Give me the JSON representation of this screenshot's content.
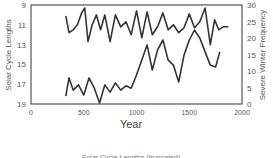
{
  "chart_data": {
    "type": "line",
    "title": "",
    "caption": "Solar Cycle Lengths (truncated)",
    "xlabel": "Year",
    "ylabel_left": "Solar Cycle Lengths",
    "ylabel_right": "Severe Winter Frequency",
    "xlim": [
      0,
      2000
    ],
    "ylim_left": [
      19,
      9
    ],
    "ylim_right": [
      0,
      30
    ],
    "left_axis_inverted": true,
    "x_ticks": [
      0,
      500,
      1000,
      1500,
      2000
    ],
    "y_ticks_left": [
      9,
      11,
      13,
      15,
      17,
      19
    ],
    "y_ticks_right": [
      0,
      5,
      10,
      15,
      20,
      25,
      30
    ],
    "grid": false,
    "legend": "none",
    "series": [
      {
        "name": "Solar Cycle Lengths",
        "axis": "left",
        "x": [
          330,
          360,
          400,
          440,
          480,
          510,
          540,
          580,
          620,
          660,
          700,
          750,
          800,
          850,
          900,
          950,
          1000,
          1050,
          1100,
          1150,
          1200,
          1250,
          1300,
          1350,
          1400,
          1450,
          1500,
          1550,
          1600,
          1650,
          1700,
          1740,
          1780,
          1820,
          1870
        ],
        "values": [
          10.1,
          11.8,
          11.5,
          11.0,
          9.8,
          9.3,
          12.7,
          11.0,
          10.0,
          11.5,
          10.0,
          12.7,
          10.0,
          11.2,
          10.7,
          12.0,
          9.6,
          12.3,
          9.7,
          12.0,
          11.2,
          9.8,
          11.5,
          11.0,
          11.8,
          11.3,
          9.9,
          11.3,
          10.7,
          9.3,
          13.0,
          10.5,
          11.5,
          11.2,
          11.2
        ]
      },
      {
        "name": "Severe Winter Frequency",
        "axis": "right",
        "x": [
          330,
          360,
          400,
          450,
          500,
          550,
          600,
          650,
          700,
          750,
          800,
          850,
          900,
          950,
          1000,
          1050,
          1100,
          1150,
          1200,
          1250,
          1300,
          1350,
          1400,
          1450,
          1500,
          1550,
          1600,
          1650,
          1700,
          1750,
          1790
        ],
        "values": [
          2.4,
          7.9,
          4.2,
          5.8,
          2.7,
          7.9,
          4.8,
          0.3,
          5.8,
          3.6,
          6.4,
          4.2,
          5.5,
          4.8,
          8.8,
          13.3,
          17.9,
          10.3,
          16.4,
          19.4,
          13.3,
          11.8,
          6.7,
          14.8,
          19.4,
          22.4,
          20.0,
          15.8,
          11.8,
          11.2,
          15.8
        ]
      }
    ]
  },
  "labels": {
    "xlabel": "Year",
    "ylabel_left": "Solar Cycle Lengths",
    "ylabel_right": "Severe Winter Frequency",
    "caption": "Solar Cycle Lengths (truncated)"
  },
  "colors": {
    "line": "#333333",
    "frame": "#555555",
    "text": "#555555"
  }
}
